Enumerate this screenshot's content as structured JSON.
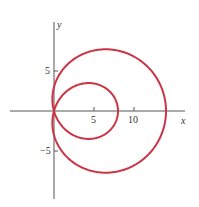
{
  "chart_data": {
    "type": "line",
    "title": "",
    "subtitle": "",
    "xlabel": "x",
    "ylabel": "y",
    "equation_hint": "polar limaçon with inner loop (approx. r = 3 + 11 cos θ)",
    "x_ticks": [
      5,
      10
    ],
    "y_ticks": [
      5,
      -5
    ],
    "x_tick_labels": [
      "5",
      "10"
    ],
    "y_tick_labels": [
      "5",
      "−5"
    ],
    "xlim": [
      -5.5,
      16.5
    ],
    "ylim": [
      -11,
      11
    ],
    "grid": false,
    "legend": null,
    "series": [
      {
        "name": "limaçon",
        "color": "#cc3344",
        "polar": {
          "a": 3,
          "b": 11,
          "form": "r = a + b cos(theta)"
        },
        "key_points": {
          "outer_loop_right_x_intercept": 14,
          "inner_loop_right_x_intercept": 8,
          "outer_loop_top_y": 7.9,
          "outer_loop_bottom_y": -7.9,
          "inner_loop_top_y": 3.5,
          "inner_loop_bottom_y": -3.5,
          "pass_through_origin": true
        }
      }
    ]
  },
  "axes": {
    "x_label": "x",
    "y_label": "y",
    "x_tick_5": "5",
    "x_tick_10": "10",
    "y_tick_5": "5",
    "y_tick_neg5": "−5"
  }
}
